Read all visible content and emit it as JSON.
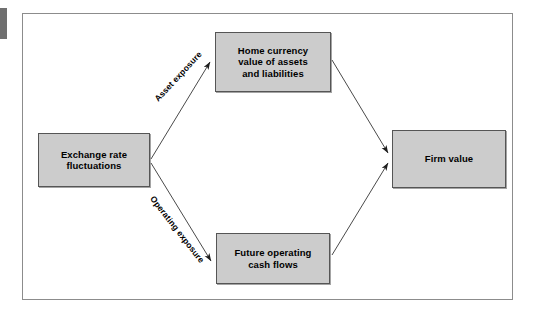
{
  "figure": {
    "background_color": "#ffffff",
    "frame_color": "#8c8c8c",
    "node_fill_color": "#cccccc",
    "node_border_color": "#555555",
    "line_color": "#4a4a4a"
  },
  "nodes": {
    "exchange": {
      "line1": "Exchange rate",
      "line2": "fluctuations"
    },
    "home_currency": {
      "line1": "Home currency",
      "line2": "value of assets",
      "line3": "and liabilities"
    },
    "future_cash": {
      "line1": "Future operating",
      "line2": "cash flows"
    },
    "firm_value": {
      "line1": "Firm value"
    }
  },
  "edge_labels": {
    "asset_exposure": "Asset exposure",
    "operating_exposure": "Operating exposure"
  },
  "edges": [
    {
      "name": "exchange-to-home",
      "from": "exchange",
      "to": "home_currency",
      "label": "Asset exposure",
      "arrowhead": "end"
    },
    {
      "name": "exchange-to-future",
      "from": "exchange",
      "to": "future_cash",
      "label": "Operating exposure",
      "arrowhead": "end"
    },
    {
      "name": "home-to-firm",
      "from": "home_currency",
      "to": "firm_value",
      "label": "",
      "arrowhead": "end"
    },
    {
      "name": "future-to-firm",
      "from": "future_cash",
      "to": "firm_value",
      "label": "",
      "arrowhead": "end"
    }
  ]
}
